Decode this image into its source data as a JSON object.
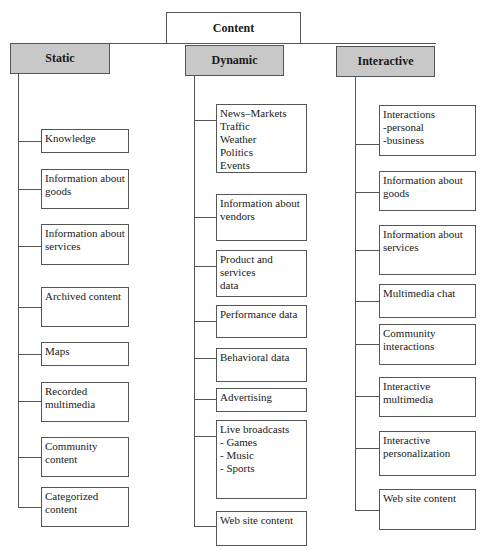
{
  "root": {
    "label": "Content"
  },
  "columns": [
    {
      "label": "Static",
      "items": [
        "Knowledge",
        "Information about\ngoods",
        "Information about\nservices",
        "Archived content",
        "Maps",
        "Recorded\nmultimedia",
        "Community content",
        "Categorized content"
      ]
    },
    {
      "label": "Dynamic",
      "items": [
        "News–Markets\nTraffic\nWeather\nPolitics\nEvents",
        "Information about\nvendors",
        "Product and services\ndata",
        "Performance data",
        "Behavioral data",
        "Advertising",
        "Live broadcasts\n- Games\n- Music\n- Sports",
        "Web site content"
      ]
    },
    {
      "label": "Interactive",
      "items": [
        "Interactions\n-personal\n-business",
        "Information about\ngoods",
        "Information about\nservices",
        "Multimedia chat",
        "Community\ninteractions",
        "Interactive multimedia",
        "Interactive\npersonalization",
        "Web site content"
      ]
    }
  ],
  "colors": {
    "header_fill": "#c8c8c8",
    "line": "#555555"
  }
}
